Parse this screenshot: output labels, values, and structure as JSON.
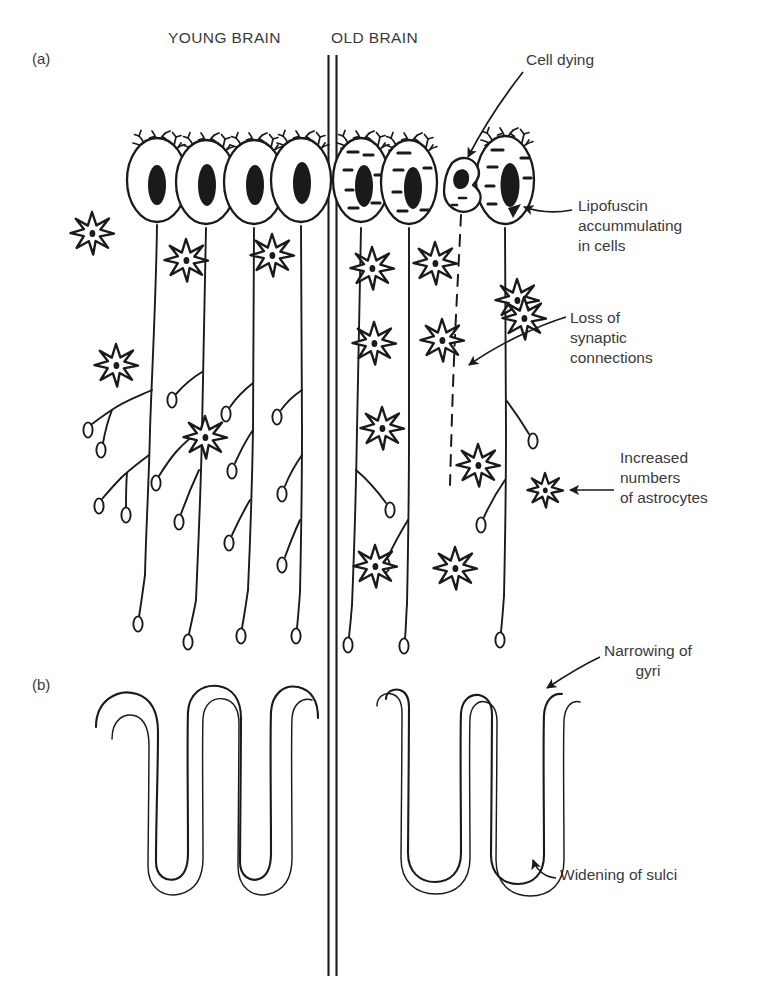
{
  "figure": {
    "headers": {
      "young": "YOUNG BRAIN",
      "old": "OLD BRAIN"
    },
    "panel_labels": {
      "a": "(a)",
      "b": "(b)"
    },
    "annotations": {
      "cell_dying": "Cell dying",
      "lipofuscin": "Lipofuscin\naccummulating\nin cells",
      "loss_synaptic": "Loss of\nsynaptic\nconnections",
      "increased_astrocytes": "Increased\nnumbers\nof astrocytes",
      "narrowing_gyri": "Narrowing of\ngyri",
      "widening_sulci": "Widening of sulci"
    },
    "colors": {
      "ink": "#1a1a1a",
      "text": "#3a3a3a",
      "background": "#ffffff"
    },
    "icon_names": {
      "neuron": "neuron-icon",
      "astrocyte": "astrocyte-star-icon",
      "dying_cell": "dying-cell-icon",
      "arrow": "leader-arrow-icon",
      "divider": "vertical-divider-icon",
      "gyri": "gyri-ribbon-icon"
    },
    "counts": {
      "young_neurons": 4,
      "old_neurons": 3,
      "young_astrocytes": 5,
      "old_astrocytes": 11,
      "dying_cells": 1,
      "young_gyri_folds": 3,
      "old_gyri_folds": 3
    }
  }
}
